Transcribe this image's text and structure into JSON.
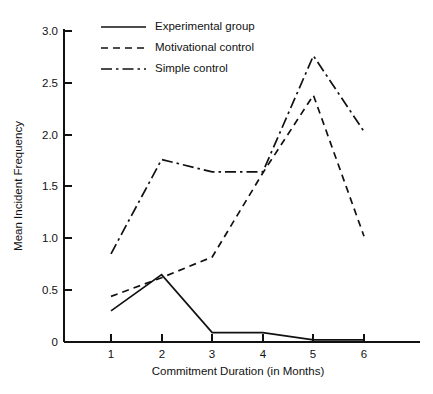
{
  "chart_data": {
    "type": "line",
    "title": "",
    "subtitle": "",
    "xlabel": "Commitment Duration (in Months)",
    "ylabel": "Mean Incident Frequency",
    "x": [
      1,
      2,
      3,
      4,
      5,
      6
    ],
    "categories": [
      "1",
      "2",
      "3",
      "4",
      "5",
      "6"
    ],
    "xlim": [
      0.6,
      6.6
    ],
    "ylim": [
      0,
      3.0
    ],
    "grid": false,
    "legend_position": "top-center",
    "x_tick_labels": [
      "1",
      "2",
      "3",
      "4",
      "5",
      "6"
    ],
    "y_tick_labels": [
      "0",
      "0.5",
      "1.0",
      "1.5",
      "2.0",
      "2.5",
      "3.0"
    ],
    "y_ticks": [
      0,
      0.5,
      1.0,
      1.5,
      2.0,
      2.5,
      3.0
    ],
    "series": [
      {
        "name": "Experimental group",
        "style": "solid",
        "color": "#111111",
        "values": [
          0.3,
          0.65,
          0.09,
          0.09,
          0.02,
          0.02
        ]
      },
      {
        "name": "Motivational control",
        "style": "dashed",
        "color": "#111111",
        "values": [
          0.44,
          0.62,
          0.82,
          1.63,
          2.38,
          1.02
        ]
      },
      {
        "name": "Simple control",
        "style": "dash-dot",
        "color": "#111111",
        "values": [
          0.85,
          1.76,
          1.64,
          1.64,
          2.76,
          2.03
        ]
      }
    ]
  },
  "legend": {
    "items": [
      {
        "label": "Experimental group"
      },
      {
        "label": "Motivational control"
      },
      {
        "label": "Simple control"
      }
    ]
  },
  "axes": {
    "y_title": "Mean Incident Frequency",
    "x_title": "Commitment Duration (in Months)",
    "y_labels": [
      "3.0",
      "2.5",
      "2.0",
      "1.5",
      "1.0",
      "0.5",
      "0"
    ],
    "x_labels": [
      "1",
      "2",
      "3",
      "4",
      "5",
      "6"
    ]
  }
}
